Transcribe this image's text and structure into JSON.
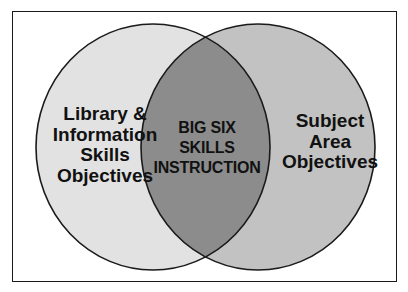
{
  "diagram": {
    "type": "venn",
    "colors": {
      "background": "#ffffff",
      "frame": "#1a1a1a",
      "left_set_fill": "#e2e2e2",
      "right_set_fill": "#c2c2c2",
      "intersection_fill": "#8c8c8c",
      "outline": "#1a1a1a",
      "text": "#111111"
    },
    "left_set": {
      "label_lines": [
        "Library &",
        "Information",
        "Skills",
        "Objectives"
      ]
    },
    "right_set": {
      "label_lines": [
        "Subject",
        "Area",
        "Objectives"
      ]
    },
    "intersection": {
      "label_lines": [
        "BIG SIX",
        "SKILLS",
        "INSTRUCTION"
      ]
    }
  }
}
